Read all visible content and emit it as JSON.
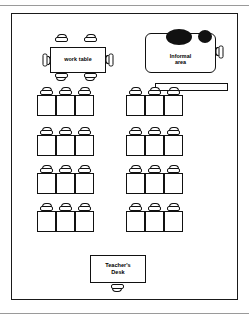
{
  "diagram": {
    "title": "Classroom Seating Layout",
    "type": "floor-plan"
  },
  "zones": {
    "work_table": {
      "label": "work table",
      "chairs": 6,
      "chair_positions": [
        "top-left",
        "top-right",
        "bottom-left",
        "bottom-right",
        "left",
        "right"
      ]
    },
    "informal_area": {
      "label_line1": "Informal",
      "label_line2": "area",
      "beanbags": 2,
      "side_chairs": 1,
      "bookshelf_label": ""
    },
    "teacher_desk": {
      "label_line1": "Teacher's",
      "label_line2": "Desk",
      "chairs": 1
    }
  },
  "student_seating": {
    "rows": 4,
    "columns": 2,
    "desks_per_cluster": 3,
    "total_clusters": 8,
    "total_desks": 24,
    "clusters": [
      {
        "id": "cluster-r1-left",
        "row": 1,
        "column": "left",
        "x": 25,
        "y": 73,
        "desks": 3
      },
      {
        "id": "cluster-r1-right",
        "row": 1,
        "column": "right",
        "x": 114,
        "y": 73,
        "desks": 3
      },
      {
        "id": "cluster-r2-left",
        "row": 2,
        "column": "left",
        "x": 25,
        "y": 113,
        "desks": 3
      },
      {
        "id": "cluster-r2-right",
        "row": 2,
        "column": "right",
        "x": 114,
        "y": 113,
        "desks": 3
      },
      {
        "id": "cluster-r3-left",
        "row": 3,
        "column": "left",
        "x": 25,
        "y": 151,
        "desks": 3
      },
      {
        "id": "cluster-r3-right",
        "row": 3,
        "column": "right",
        "x": 114,
        "y": 151,
        "desks": 3
      },
      {
        "id": "cluster-r4-left",
        "row": 4,
        "column": "left",
        "x": 25,
        "y": 189,
        "desks": 3
      },
      {
        "id": "cluster-r4-right",
        "row": 4,
        "column": "right",
        "x": 114,
        "y": 189,
        "desks": 3
      }
    ]
  },
  "colors": {
    "line": "#1a1a1a",
    "fill": "#ffffff",
    "beanbag": "#111111",
    "page_rule": "#9a9a9a"
  }
}
